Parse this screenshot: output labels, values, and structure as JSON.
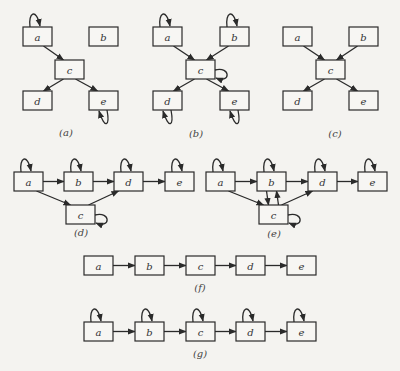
{
  "figure": {
    "panels": [
      {
        "id": "a",
        "caption": "(a)",
        "caption_pos": [
          66,
          136
        ],
        "nodes": [
          {
            "id": "a",
            "label": "a",
            "x": 23,
            "y": 27
          },
          {
            "id": "b",
            "label": "b",
            "x": 89,
            "y": 27
          },
          {
            "id": "c",
            "label": "c",
            "x": 55,
            "y": 60
          },
          {
            "id": "d",
            "label": "d",
            "x": 23,
            "y": 91
          },
          {
            "id": "e",
            "label": "e",
            "x": 89,
            "y": 91
          }
        ],
        "edges": [
          [
            "a",
            "c"
          ],
          [
            "c",
            "d"
          ],
          [
            "c",
            "e"
          ]
        ],
        "self_loops": [
          {
            "node": "a",
            "side": "top"
          },
          {
            "node": "e",
            "side": "bottom"
          }
        ]
      },
      {
        "id": "b",
        "caption": "(b)",
        "caption_pos": [
          196,
          137
        ],
        "nodes": [
          {
            "id": "a",
            "label": "a",
            "x": 153,
            "y": 27
          },
          {
            "id": "b",
            "label": "b",
            "x": 220,
            "y": 27
          },
          {
            "id": "c",
            "label": "c",
            "x": 186,
            "y": 60
          },
          {
            "id": "d",
            "label": "d",
            "x": 153,
            "y": 91
          },
          {
            "id": "e",
            "label": "e",
            "x": 220,
            "y": 91
          }
        ],
        "edges": [
          [
            "a",
            "c"
          ],
          [
            "b",
            "c"
          ],
          [
            "c",
            "d"
          ],
          [
            "c",
            "e"
          ]
        ],
        "self_loops": [
          {
            "node": "a",
            "side": "top"
          },
          {
            "node": "b",
            "side": "top"
          },
          {
            "node": "c",
            "side": "right"
          },
          {
            "node": "d",
            "side": "bottom"
          },
          {
            "node": "e",
            "side": "bottom"
          }
        ]
      },
      {
        "id": "c",
        "caption": "(c)",
        "caption_pos": [
          335,
          137
        ],
        "nodes": [
          {
            "id": "a",
            "label": "a",
            "x": 283,
            "y": 27
          },
          {
            "id": "b",
            "label": "b",
            "x": 349,
            "y": 27
          },
          {
            "id": "c",
            "label": "c",
            "x": 316,
            "y": 60
          },
          {
            "id": "d",
            "label": "d",
            "x": 283,
            "y": 91
          },
          {
            "id": "e",
            "label": "e",
            "x": 349,
            "y": 91
          }
        ],
        "edges": [
          [
            "a",
            "c"
          ],
          [
            "b",
            "c"
          ],
          [
            "c",
            "d"
          ],
          [
            "c",
            "e"
          ]
        ],
        "self_loops": []
      },
      {
        "id": "d",
        "caption": "(d)",
        "caption_pos": [
          81,
          236
        ],
        "nodes": [
          {
            "id": "a",
            "label": "a",
            "x": 14,
            "y": 172
          },
          {
            "id": "b",
            "label": "b",
            "x": 64,
            "y": 172
          },
          {
            "id": "d",
            "label": "d",
            "x": 114,
            "y": 172
          },
          {
            "id": "e",
            "label": "e",
            "x": 165,
            "y": 172
          },
          {
            "id": "c",
            "label": "c",
            "x": 66,
            "y": 205
          }
        ],
        "edges": [
          [
            "a",
            "b"
          ],
          [
            "b",
            "d"
          ],
          [
            "d",
            "e"
          ],
          [
            "a",
            "c"
          ],
          [
            "c",
            "d"
          ]
        ],
        "self_loops": [
          {
            "node": "a",
            "side": "top"
          },
          {
            "node": "b",
            "side": "top"
          },
          {
            "node": "d",
            "side": "top"
          },
          {
            "node": "e",
            "side": "top"
          },
          {
            "node": "c",
            "side": "right"
          }
        ]
      },
      {
        "id": "e",
        "caption": "(e)",
        "caption_pos": [
          274,
          237
        ],
        "nodes": [
          {
            "id": "a",
            "label": "a",
            "x": 206,
            "y": 172
          },
          {
            "id": "b",
            "label": "b",
            "x": 257,
            "y": 172
          },
          {
            "id": "d",
            "label": "d",
            "x": 308,
            "y": 172
          },
          {
            "id": "e",
            "label": "e",
            "x": 358,
            "y": 172
          },
          {
            "id": "c",
            "label": "c",
            "x": 259,
            "y": 205
          }
        ],
        "edges": [
          [
            "a",
            "b"
          ],
          [
            "b",
            "d"
          ],
          [
            "d",
            "e"
          ],
          [
            "a",
            "c"
          ],
          [
            "c",
            "d"
          ],
          [
            "b",
            "c",
            "left"
          ],
          [
            "c",
            "b",
            "right"
          ]
        ],
        "self_loops": [
          {
            "node": "a",
            "side": "top"
          },
          {
            "node": "b",
            "side": "top"
          },
          {
            "node": "d",
            "side": "top"
          },
          {
            "node": "e",
            "side": "top"
          },
          {
            "node": "c",
            "side": "right"
          }
        ]
      },
      {
        "id": "f",
        "caption": "(f)",
        "caption_pos": [
          200,
          291
        ],
        "nodes": [
          {
            "id": "a",
            "label": "a",
            "x": 84,
            "y": 256
          },
          {
            "id": "b",
            "label": "b",
            "x": 135,
            "y": 256
          },
          {
            "id": "c",
            "label": "c",
            "x": 186,
            "y": 256
          },
          {
            "id": "d",
            "label": "d",
            "x": 236,
            "y": 256
          },
          {
            "id": "e",
            "label": "e",
            "x": 287,
            "y": 256
          }
        ],
        "edges": [
          [
            "a",
            "b"
          ],
          [
            "b",
            "c"
          ],
          [
            "c",
            "d"
          ],
          [
            "d",
            "e"
          ]
        ],
        "self_loops": []
      },
      {
        "id": "g",
        "caption": "(g)",
        "caption_pos": [
          200,
          357
        ],
        "nodes": [
          {
            "id": "a",
            "label": "a",
            "x": 84,
            "y": 322
          },
          {
            "id": "b",
            "label": "b",
            "x": 135,
            "y": 322
          },
          {
            "id": "c",
            "label": "c",
            "x": 186,
            "y": 322
          },
          {
            "id": "d",
            "label": "d",
            "x": 236,
            "y": 322
          },
          {
            "id": "e",
            "label": "e",
            "x": 287,
            "y": 322
          }
        ],
        "edges": [
          [
            "a",
            "b"
          ],
          [
            "b",
            "c"
          ],
          [
            "c",
            "d"
          ],
          [
            "d",
            "e"
          ]
        ],
        "self_loops": [
          {
            "node": "a",
            "side": "top"
          },
          {
            "node": "b",
            "side": "top"
          },
          {
            "node": "c",
            "side": "top"
          },
          {
            "node": "d",
            "side": "top"
          },
          {
            "node": "e",
            "side": "top"
          }
        ]
      }
    ],
    "node_size": {
      "w": 29,
      "h": 19
    },
    "colors": {
      "stroke": "#2a2a2a",
      "background": "#f4f3f0",
      "node_fill": "#f7f6f3"
    }
  }
}
